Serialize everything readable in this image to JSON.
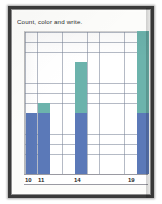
{
  "document": {
    "title": "Count, color and write.",
    "frame_color": "#3a3a3a",
    "paper_color": "#fcfcfa"
  },
  "chart_data": {
    "type": "bar",
    "title": "Count, color and write.",
    "xlabel": "",
    "ylabel": "",
    "grid": true,
    "legend": "none",
    "stacked": true,
    "grid_columns": 10,
    "grid_rows": 14,
    "ylim": [
      0,
      14
    ],
    "categories": [
      "10",
      "11",
      "14",
      "19"
    ],
    "tick_labels": [
      "10",
      "11",
      "14",
      "19"
    ],
    "colors": {
      "blue": "#5b79b8",
      "teal": "#6cb3ac",
      "gridline": "#7882961",
      "axis": "#9a9aa2"
    },
    "series": [
      {
        "name": "colored-blue",
        "color": "#5b79b8",
        "values": [
          6,
          6,
          6,
          6
        ]
      },
      {
        "name": "colored-teal",
        "color": "#6cb3ac",
        "values": [
          0,
          1,
          5,
          8
        ]
      }
    ],
    "bars": [
      {
        "label": "10",
        "blue": 6,
        "teal": 0,
        "total": 6,
        "column": 0
      },
      {
        "label": "11",
        "blue": 6,
        "teal": 1,
        "total": 7,
        "column": 1
      },
      {
        "label": "14",
        "blue": 6,
        "teal": 5,
        "total": 11,
        "column": 4
      },
      {
        "label": "19",
        "blue": 6,
        "teal": 8,
        "total": 14,
        "column": 9
      }
    ]
  },
  "axis": {
    "labels": [
      {
        "text": "10",
        "left_px": 1
      },
      {
        "text": "11",
        "left_px": 14
      },
      {
        "text": "14",
        "left_px": 50
      },
      {
        "text": "19",
        "left_px": 104
      }
    ]
  }
}
